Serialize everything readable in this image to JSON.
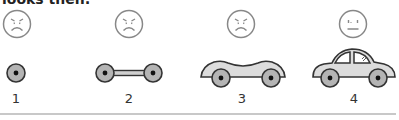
{
  "header": {
    "text": "looks then:"
  },
  "stages": [
    {
      "number": "1",
      "face": "angry-face",
      "vehicle": "single-wheel"
    },
    {
      "number": "2",
      "face": "angry-face",
      "vehicle": "axle-with-two-wheels"
    },
    {
      "number": "3",
      "face": "angry-face",
      "vehicle": "car-body-without-roof"
    },
    {
      "number": "4",
      "face": "neutral-face",
      "vehicle": "complete-car"
    }
  ],
  "colors": {
    "outline": "#333333",
    "body_fill": "#dcdcdc",
    "wheel_fill": "#b4b4b4",
    "face_stroke": "#888888",
    "divider": "#c8c8c8"
  }
}
